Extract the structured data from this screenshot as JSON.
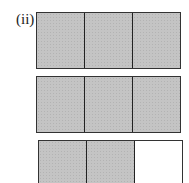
{
  "label": "(ii)",
  "bars": [
    {
      "cells": [
        "shaded",
        "shaded",
        "shaded"
      ]
    },
    {
      "cells": [
        "shaded",
        "shaded",
        "shaded"
      ]
    },
    {
      "cells": [
        "shaded",
        "shaded",
        "empty"
      ]
    }
  ],
  "colors": {
    "shaded": "#c4c4c4",
    "border": "#333333",
    "empty": "#ffffff"
  }
}
